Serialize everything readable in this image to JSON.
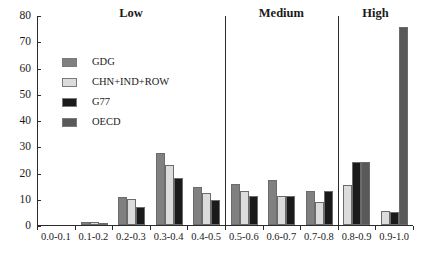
{
  "chart_data": {
    "type": "bar",
    "title": "",
    "xlabel": "",
    "ylabel": "",
    "ylim": [
      0,
      80
    ],
    "ytick_labels": [
      "0",
      "10",
      "20",
      "30",
      "40",
      "50",
      "60",
      "70",
      "80"
    ],
    "ytick_values": [
      0,
      10,
      20,
      30,
      40,
      50,
      60,
      70,
      80
    ],
    "grid": false,
    "legend_position": "upper-left-inside",
    "categories": [
      "0.0-0.1",
      "0.1-0.2",
      "0.2-0.3",
      "0.3-0.4",
      "0.4-0.5",
      "0.5-0.6",
      "0.6-0.7",
      "0.7-0.8",
      "0.8-0.9",
      "0.9-1.0"
    ],
    "series": [
      {
        "name": "GDG",
        "color": "#808080",
        "values": [
          0,
          1.2,
          10.5,
          27.5,
          14.3,
          15.7,
          17.0,
          13.0,
          0,
          0
        ]
      },
      {
        "name": "CHN+IND+ROW",
        "color": "#dcdcdc",
        "values": [
          0,
          1.0,
          9.8,
          23.0,
          12.1,
          13.0,
          11.0,
          8.7,
          15.3,
          5.5
        ]
      },
      {
        "name": "G77",
        "color": "#1a1a1a",
        "values": [
          0,
          0.8,
          6.9,
          18.0,
          9.4,
          11.0,
          11.1,
          12.8,
          24.0,
          5.0
        ]
      },
      {
        "name": "OECD",
        "color": "#595959",
        "values": [
          0,
          0,
          0,
          0,
          0,
          0,
          0,
          0,
          24.0,
          75.6
        ]
      }
    ],
    "sections": [
      {
        "label": "Low",
        "start_index": 0,
        "end_index": 4
      },
      {
        "label": "Medium",
        "start_index": 5,
        "end_index": 7
      },
      {
        "label": "High",
        "start_index": 8,
        "end_index": 9
      }
    ],
    "legend_entries": [
      {
        "label": "GDG",
        "color": "#808080"
      },
      {
        "label": "CHN+IND+ROW",
        "color": "#dcdcdc"
      },
      {
        "label": "G77",
        "color": "#1a1a1a"
      },
      {
        "label": "OECD",
        "color": "#595959"
      }
    ]
  },
  "colors": {
    "axis": "#2b2b2b",
    "text": "#1a1a1a",
    "background": "#ffffff",
    "bar_outline": "#6b6b6b"
  }
}
